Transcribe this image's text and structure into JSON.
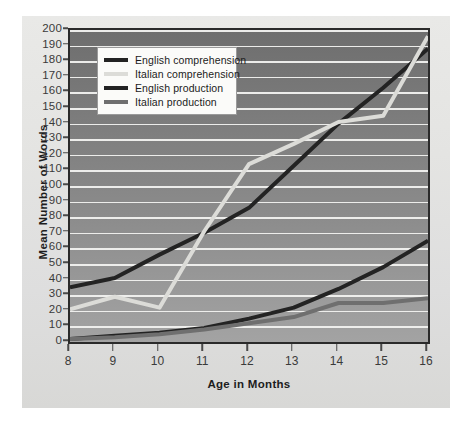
{
  "chart_data": {
    "type": "line",
    "title": "",
    "xlabel": "Age in Months",
    "ylabel": "Mean Number of Words",
    "x": [
      8,
      9,
      10,
      11,
      12,
      13,
      14,
      15,
      16
    ],
    "categories": [
      "8",
      "9",
      "10",
      "11",
      "12",
      "13",
      "14",
      "15",
      "16"
    ],
    "xlim": [
      8,
      16
    ],
    "ylim": [
      0,
      200
    ],
    "ytick_labels": [
      "0",
      "10",
      "20",
      "30",
      "40",
      "50",
      "60",
      "70",
      "80",
      "90",
      "100",
      "110",
      "120",
      "130",
      "140",
      "150",
      "160",
      "170",
      "180",
      "190",
      "200"
    ],
    "ytick_values": [
      0,
      10,
      20,
      30,
      40,
      50,
      60,
      70,
      80,
      90,
      100,
      110,
      120,
      130,
      140,
      150,
      160,
      170,
      180,
      190,
      200
    ],
    "grid": true,
    "grid_axis": "y",
    "legend_position": "upper left (inside plot)",
    "series": [
      {
        "name": "English comprehension",
        "color": "#232323",
        "values": [
          35,
          41,
          56,
          70,
          86,
          113,
          140,
          163,
          188
        ]
      },
      {
        "name": "Italian comprehension",
        "color": "#dcdcd8",
        "values": [
          21,
          29,
          22,
          71,
          114,
          127,
          141,
          145,
          196
        ]
      },
      {
        "name": "English production",
        "color": "#232323",
        "values": [
          2,
          4,
          6,
          9,
          15,
          22,
          34,
          48,
          65
        ]
      },
      {
        "name": "Italian production",
        "color": "#6f6f6f",
        "values": [
          2,
          3,
          5,
          8,
          12,
          16,
          25,
          25,
          28
        ]
      }
    ]
  },
  "legend": {
    "items": [
      {
        "label": "English comprehension",
        "color": "#232323"
      },
      {
        "label": "Italian comprehension",
        "color": "#dcdcd8"
      },
      {
        "label": "English production",
        "color": "#232323"
      },
      {
        "label": "Italian production",
        "color": "#6f6f6f"
      }
    ]
  },
  "colors": {
    "plot_background_top": "#6e6e6e",
    "plot_background_bottom": "#a3a3a3",
    "panel_background": "#e6e6e4",
    "gridline": "#f2f2f0",
    "frame": "#2a2a2a",
    "axis_text": "#3a3a3a",
    "axis_title": "#1d1d1d",
    "legend_background": "#fbfbf9"
  }
}
